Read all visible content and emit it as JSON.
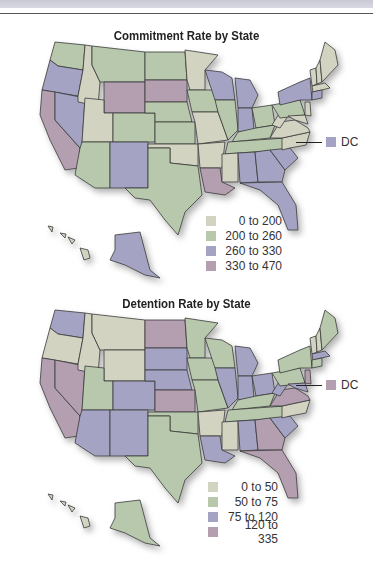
{
  "colors": {
    "c0": "#d3d3c2",
    "c1": "#b7c8ac",
    "c2": "#a4a3c4",
    "c3": "#b49fb1"
  },
  "maps": [
    {
      "title": "Commitment Rate by State",
      "legend": [
        {
          "label": "0 to 200",
          "color": "#d3d3c2"
        },
        {
          "label": "200 to 260",
          "color": "#b7c8ac"
        },
        {
          "label": "260 to 330",
          "color": "#a4a3c4"
        },
        {
          "label": "330 to 470",
          "color": "#b49fb1"
        }
      ],
      "dc": {
        "label": "DC",
        "color": "#a4a3c4"
      }
    },
    {
      "title": "Detention Rate by State",
      "legend": [
        {
          "label": "0 to 50",
          "color": "#d3d3c2"
        },
        {
          "label": "50 to 75",
          "color": "#b7c8ac"
        },
        {
          "label": "75 to 120",
          "color": "#a4a3c4"
        },
        {
          "label": "120 to 335",
          "color": "#b49fb1"
        }
      ],
      "dc": {
        "label": "DC",
        "color": "#b49fb1"
      }
    }
  ]
}
